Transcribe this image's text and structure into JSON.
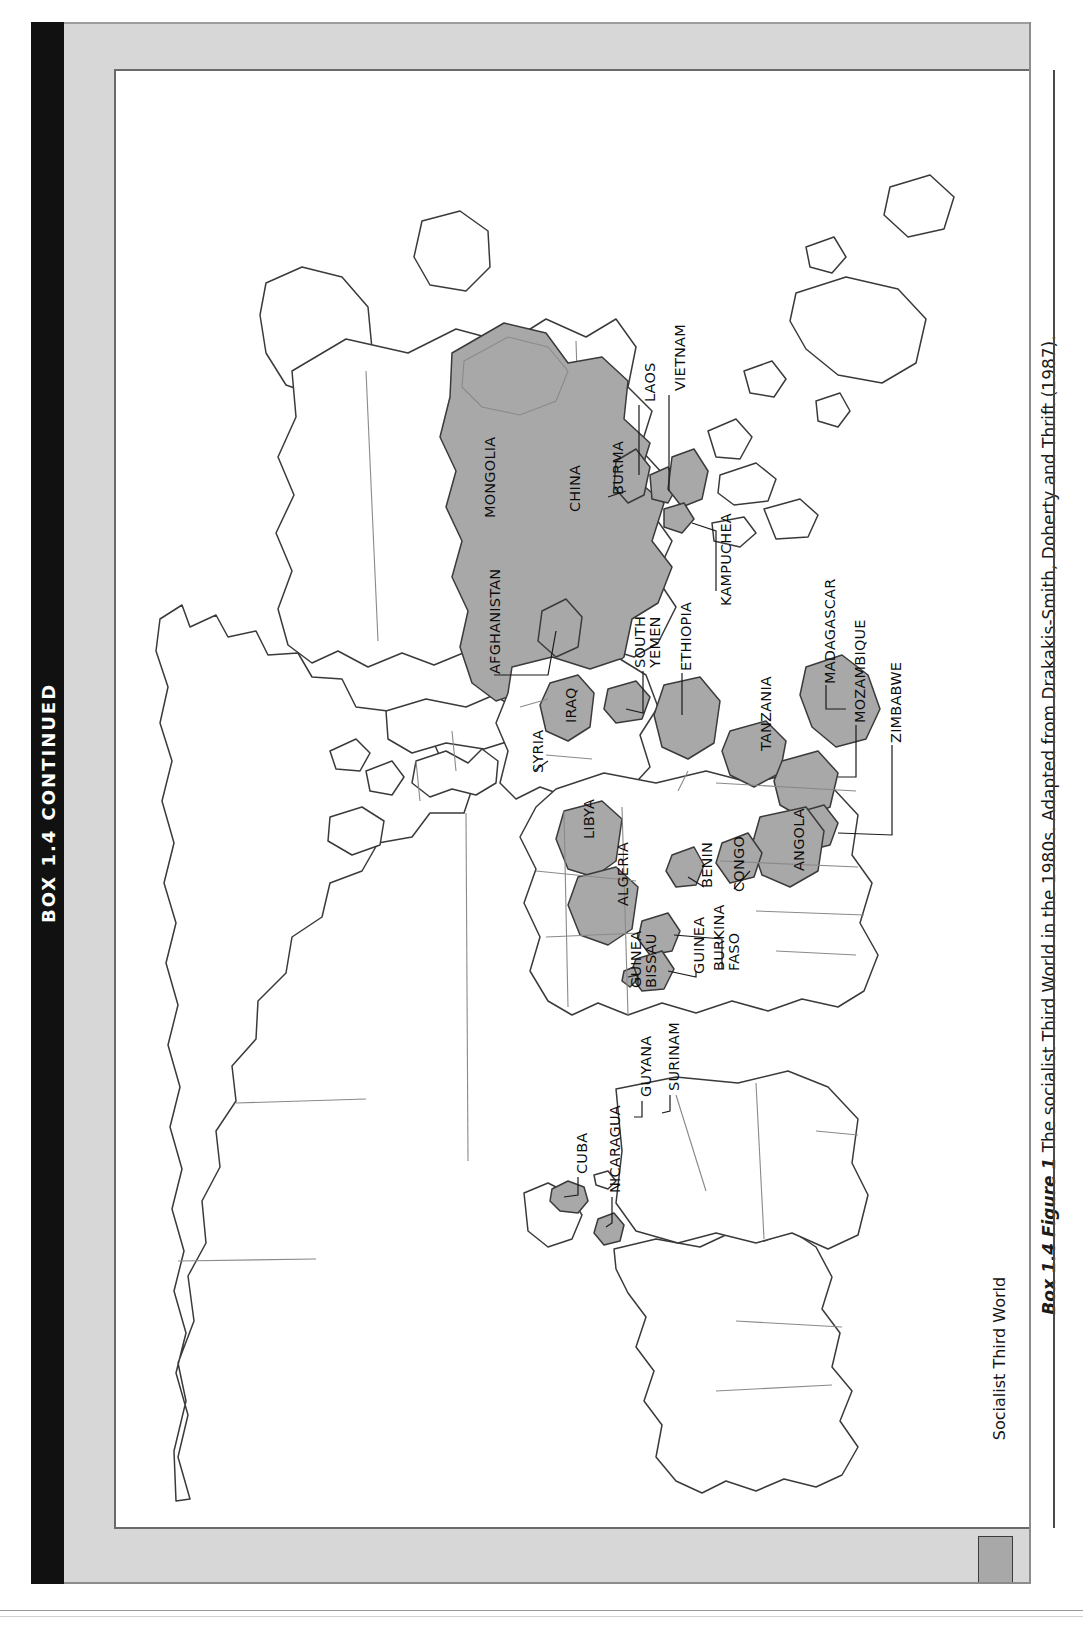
{
  "box": {
    "spine_title": "BOX 1.4 CONTINUED"
  },
  "caption": {
    "lead": "Box 1.4 Figure 1",
    "text": " The socialist Third World in the 1980s. Adapted from Drakakis-Smith, Doherty and Thrift (1987).",
    "full": "Box 1.4 Figure 1 The socialist Third World in the 1980s. Adapted from Drakakis-Smith, Doherty and Thrift (1987)."
  },
  "legend": {
    "label": "Socialist Third World",
    "swatch_color": "#a8a8a8",
    "swatch_border": "#3c3c3c"
  },
  "colors": {
    "socialist_fill": "#a8a8a8",
    "land_fill": "#ffffff",
    "coastline": "#3a3a3a",
    "border_line": "#6d6d6d",
    "panel_gray": "#d7d7d7",
    "spine_black": "#111111"
  },
  "map": {
    "type": "world-choropleth",
    "projection": "equirectangular-ish",
    "title_on_map": "",
    "shaded_category": "Socialist Third World",
    "labelled_countries": [
      "MONGOLIA",
      "CHINA",
      "BURMA",
      "LAOS",
      "VIETNAM",
      "KAMPUCHEA",
      "AFGHANISTAN",
      "SOUTH YEMEN",
      "ETHIOPIA",
      "IRAQ",
      "SYRIA",
      "LIBYA",
      "ALGERIA",
      "BENIN",
      "CONGO",
      "ANGOLA",
      "TANZANIA",
      "MOZAMBIQUE",
      "ZIMBABWE",
      "MADAGASCAR",
      "GUINEA",
      "GUINEA BISSAU",
      "BURKINA FASO",
      "CUBA",
      "NICARAGUA",
      "GUYANA",
      "SURINAM"
    ],
    "labels": [
      {
        "name": "MONGOLIA",
        "text": "MONGOLIA",
        "x": 367,
        "y": 447,
        "lines": 1,
        "leader": false
      },
      {
        "name": "CHINA",
        "text": "CHINA",
        "x": 452,
        "y": 441,
        "lines": 1,
        "leader": false
      },
      {
        "name": "BURMA",
        "text": "BURMA",
        "x": 495,
        "y": 424,
        "lines": 1,
        "leader": true
      },
      {
        "name": "LAOS",
        "text": "LAOS",
        "x": 527,
        "y": 331,
        "lines": 1,
        "leader": true
      },
      {
        "name": "VIETNAM",
        "text": "VIETNAM",
        "x": 557,
        "y": 320,
        "lines": 1,
        "leader": true
      },
      {
        "name": "KAMPUCHEA",
        "text": "KAMPUCHEA",
        "x": 603,
        "y": 535,
        "lines": 1,
        "leader": true
      },
      {
        "name": "AFGHANISTAN",
        "text": "AFGHANISTAN",
        "x": 372,
        "y": 603,
        "lines": 1,
        "leader": true
      },
      {
        "name": "SOUTH YEMEN",
        "text": "SOUTH YEMEN",
        "x": 523,
        "y": 597,
        "lines": 2,
        "leader": true
      },
      {
        "name": "ETHIOPIA",
        "text": "ETHIOPIA",
        "x": 563,
        "y": 600,
        "lines": 1,
        "leader": true
      },
      {
        "name": "IRAQ",
        "text": "IRAQ",
        "x": 448,
        "y": 652,
        "lines": 1,
        "leader": false
      },
      {
        "name": "SYRIA",
        "text": "SYRIA",
        "x": 415,
        "y": 702,
        "lines": 1,
        "leader": true
      },
      {
        "name": "LIBYA",
        "text": "LIBYA",
        "x": 466,
        "y": 768,
        "lines": 1,
        "leader": false
      },
      {
        "name": "ALGERIA",
        "text": "ALGERIA",
        "x": 500,
        "y": 835,
        "lines": 1,
        "leader": false
      },
      {
        "name": "BENIN",
        "text": "BENIN",
        "x": 584,
        "y": 817,
        "lines": 1,
        "leader": true
      },
      {
        "name": "CONGO",
        "text": "CONGO",
        "x": 616,
        "y": 821,
        "lines": 1,
        "leader": true
      },
      {
        "name": "ANGOLA",
        "text": "ANGOLA",
        "x": 676,
        "y": 800,
        "lines": 1,
        "leader": false
      },
      {
        "name": "TANZANIA",
        "text": "TANZANIA",
        "x": 643,
        "y": 680,
        "lines": 1,
        "leader": false
      },
      {
        "name": "MOZAMBIQUE",
        "text": "MOZAMBIQUE",
        "x": 737,
        "y": 652,
        "lines": 1,
        "leader": true
      },
      {
        "name": "ZIMBABWE",
        "text": "ZIMBABWE",
        "x": 773,
        "y": 672,
        "lines": 1,
        "leader": true
      },
      {
        "name": "MADAGASCAR",
        "text": "MADAGASCAR",
        "x": 707,
        "y": 613,
        "lines": 1,
        "leader": true
      },
      {
        "name": "GUINEA BISSAU",
        "text": "GUINEA BISSAU",
        "x": 519,
        "y": 917,
        "lines": 2,
        "leader": true
      },
      {
        "name": "GUINEA",
        "text": "GUINEA",
        "x": 576,
        "y": 903,
        "lines": 1,
        "leader": true
      },
      {
        "name": "BURKINA FASO",
        "text": "BURKINA FASO",
        "x": 602,
        "y": 900,
        "lines": 2,
        "leader": true
      },
      {
        "name": "CUBA",
        "text": "CUBA",
        "x": 459,
        "y": 1103,
        "lines": 1,
        "leader": true
      },
      {
        "name": "NICARAGUA",
        "text": "NICARAGUA",
        "x": 492,
        "y": 1122,
        "lines": 1,
        "leader": true
      },
      {
        "name": "GUYANA",
        "text": "GUYANA",
        "x": 523,
        "y": 1026,
        "lines": 1,
        "leader": true
      },
      {
        "name": "SURINAM",
        "text": "SURINAM",
        "x": 551,
        "y": 1020,
        "lines": 1,
        "leader": true
      }
    ]
  }
}
